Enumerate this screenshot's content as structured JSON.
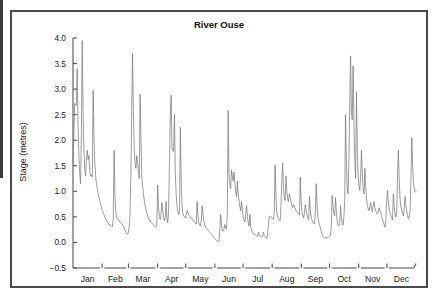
{
  "figure": {
    "title": "River Ouse",
    "y_axis_label": "Stage (metres)",
    "line_color": "#7a7a7a",
    "axis_color": "#555555",
    "frame_color": "#4a4a4a",
    "background": "#ffffff"
  },
  "chart_data": {
    "type": "line",
    "title": "River Ouse",
    "xlabel": "",
    "ylabel": "Stage (metres)",
    "ylim": [
      -0.5,
      4.0
    ],
    "yticks": [
      4.0,
      3.5,
      3.0,
      2.5,
      2.0,
      1.5,
      1.0,
      0.5,
      0.0,
      -0.5
    ],
    "ytick_labels": [
      "4.0",
      "3.5",
      "3.0",
      "2.5",
      "2.0",
      "1.5",
      "1.0",
      "0.5",
      "0.0",
      "−0.5"
    ],
    "grid": false,
    "legend": null,
    "x_categories": [
      "Jan",
      "Feb",
      "Mar",
      "Apr",
      "May",
      "Jun",
      "Jul",
      "Aug",
      "Sep",
      "Oct",
      "Nov",
      "Dec"
    ],
    "x_units": "days of year (365 daily river stage readings)",
    "series": [
      {
        "name": "Stage",
        "color": "#7a7a7a",
        "values": [
          1.55,
          2.05,
          2.72,
          2.7,
          2.68,
          3.4,
          2.3,
          1.7,
          1.35,
          1.15,
          2.1,
          3.95,
          2.6,
          1.8,
          1.45,
          1.3,
          1.65,
          1.8,
          1.62,
          1.7,
          1.4,
          1.3,
          1.32,
          1.28,
          2.98,
          2.1,
          1.55,
          1.3,
          1.15,
          1.05,
          0.95,
          0.88,
          0.8,
          0.74,
          0.68,
          0.62,
          0.58,
          0.54,
          0.5,
          0.46,
          0.43,
          0.4,
          0.38,
          0.36,
          0.34,
          0.33,
          0.32,
          0.31,
          0.45,
          1.8,
          0.95,
          0.6,
          0.5,
          0.46,
          0.44,
          0.42,
          0.4,
          0.38,
          0.36,
          0.34,
          0.32,
          0.3,
          0.24,
          0.2,
          0.17,
          0.16,
          0.19,
          0.3,
          0.55,
          1.3,
          2.6,
          3.7,
          2.6,
          1.85,
          1.55,
          1.45,
          1.7,
          1.55,
          1.4,
          1.25,
          2.9,
          2.05,
          1.3,
          1.1,
          0.95,
          0.82,
          0.72,
          0.64,
          0.58,
          0.52,
          0.47,
          0.44,
          0.42,
          0.4,
          0.38,
          0.36,
          0.34,
          0.32,
          0.31,
          0.3,
          0.4,
          1.12,
          0.7,
          0.5,
          0.45,
          0.55,
          0.78,
          0.62,
          0.48,
          0.42,
          0.5,
          0.8,
          0.46,
          0.38,
          0.62,
          1.5,
          2.45,
          2.88,
          1.85,
          1.8,
          1.78,
          2.5,
          1.35,
          0.95,
          0.72,
          0.6,
          0.54,
          0.6,
          2.25,
          1.2,
          0.72,
          0.56,
          0.52,
          0.5,
          0.48,
          0.55,
          0.62,
          0.58,
          0.54,
          0.52,
          0.5,
          0.48,
          0.46,
          0.44,
          0.42,
          0.4,
          0.38,
          0.36,
          0.8,
          0.52,
          0.38,
          0.34,
          0.32,
          0.44,
          0.72,
          0.58,
          0.42,
          0.34,
          0.3,
          0.28,
          0.26,
          0.24,
          0.22,
          0.2,
          0.18,
          0.16,
          0.14,
          0.12,
          0.1,
          0.08,
          0.06,
          0.04,
          0.03,
          0.02,
          0.02,
          0.2,
          0.55,
          0.38,
          0.24,
          0.22,
          0.25,
          0.35,
          0.3,
          0.26,
          0.55,
          2.58,
          1.35,
          1.15,
          1.05,
          1.42,
          1.3,
          1.2,
          1.38,
          1.15,
          1.0,
          0.9,
          1.2,
          0.95,
          0.8,
          0.7,
          0.62,
          0.8,
          0.62,
          0.5,
          0.44,
          0.4,
          0.55,
          0.72,
          0.5,
          0.38,
          0.32,
          0.55,
          0.3,
          0.24,
          0.2,
          0.18,
          0.16,
          0.15,
          0.14,
          0.13,
          0.12,
          0.2,
          0.14,
          0.12,
          0.11,
          0.1,
          0.12,
          0.2,
          0.14,
          0.11,
          0.09,
          0.08,
          0.12,
          0.35,
          0.5,
          0.52,
          0.5,
          0.48,
          0.46,
          0.45,
          0.6,
          1.52,
          0.9,
          0.6,
          0.5,
          0.46,
          0.44,
          0.42,
          0.72,
          1.2,
          1.55,
          1.05,
          0.88,
          0.82,
          1.3,
          1.0,
          0.85,
          0.8,
          0.95,
          0.88,
          0.8,
          0.72,
          0.68,
          0.74,
          0.7,
          0.66,
          0.62,
          0.6,
          0.58,
          0.56,
          0.54,
          1.28,
          0.82,
          0.6,
          0.52,
          0.48,
          0.58,
          0.74,
          0.62,
          0.54,
          0.48,
          0.44,
          0.9,
          0.62,
          0.5,
          0.44,
          0.4,
          0.38,
          0.36,
          0.6,
          1.15,
          0.72,
          0.5,
          0.4,
          0.34,
          0.28,
          0.22,
          0.16,
          0.12,
          0.1,
          0.09,
          0.09,
          0.09,
          0.1,
          0.1,
          0.11,
          0.12,
          0.14,
          0.3,
          0.92,
          0.7,
          0.58,
          0.52,
          0.88,
          0.62,
          0.42,
          0.34,
          0.32,
          0.36,
          0.72,
          0.5,
          0.38,
          0.34,
          0.5,
          0.82,
          2.5,
          1.6,
          1.05,
          0.95,
          1.6,
          2.7,
          3.65,
          2.55,
          2.4,
          3.45,
          2.3,
          1.6,
          1.25,
          2.95,
          1.85,
          1.3,
          1.1,
          1.02,
          1.3,
          1.8,
          1.35,
          1.05,
          0.95,
          1.45,
          1.1,
          0.85,
          0.72,
          0.66,
          0.62,
          0.7,
          0.78,
          0.66,
          0.6,
          0.72,
          0.8,
          0.68,
          0.62,
          0.58,
          0.56,
          0.6,
          0.68,
          0.62,
          0.58,
          0.52,
          0.46,
          0.4,
          0.34,
          0.3,
          0.42,
          0.8,
          1.02,
          0.8,
          0.66,
          0.58,
          0.52,
          0.48,
          0.44,
          0.95,
          0.7,
          0.56,
          0.5,
          0.58,
          1.35,
          1.8,
          1.2,
          0.85,
          0.7,
          0.62,
          0.56,
          0.52,
          0.7,
          0.9,
          0.72,
          0.6,
          0.52,
          0.46,
          0.5,
          0.62,
          1.25,
          2.05,
          1.5,
          1.18,
          1.05,
          0.98,
          1.0
        ]
      }
    ]
  }
}
